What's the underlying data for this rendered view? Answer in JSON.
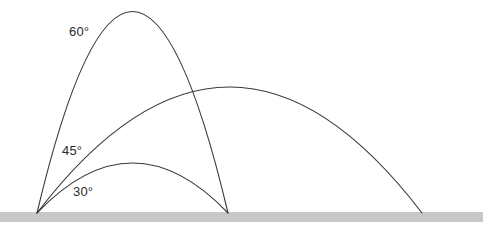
{
  "figure": {
    "width": 483,
    "height": 230,
    "background_color": "#ffffff",
    "clipped_top_text": ""
  },
  "ground": {
    "label": "ground",
    "color": "#c8c8c8",
    "x": 0,
    "y": 212,
    "width": 483,
    "height": 10
  },
  "launch_point": {
    "label": "launch point",
    "x": 37,
    "y": 213
  },
  "labels": {
    "angle_60": "60°",
    "angle_45": "45°",
    "angle_30": "30°"
  },
  "style": {
    "curve_color": "#3a3a3a",
    "curve_width": 1.1,
    "label_color": "#2b2b2b"
  },
  "chart_data": {
    "type": "line",
    "xlabel": "",
    "ylabel": "",
    "xlim": [
      0,
      483
    ],
    "ylim": [
      0,
      230
    ],
    "grid": false,
    "legend": "inline-annotations",
    "origin": [
      37,
      213
    ],
    "ground_y": 212,
    "series": [
      {
        "name": "60°",
        "angle_deg": 60,
        "launch_x": 37,
        "landing_x": 228,
        "range_px": 191,
        "apex_x": 130,
        "apex_y": 11,
        "peak_height_px": 202,
        "path": "M 37 213 Q 132.5 -190 228 213"
      },
      {
        "name": "45°",
        "angle_deg": 45,
        "launch_x": 37,
        "landing_x": 422,
        "range_px": 385,
        "apex_x": 225,
        "apex_y": 87,
        "peak_height_px": 126,
        "path": "M 37 213 Q 229.5 -39 422 213"
      },
      {
        "name": "30°",
        "angle_deg": 30,
        "launch_x": 37,
        "landing_x": 228,
        "range_px": 191,
        "apex_x": 133,
        "apex_y": 163,
        "peak_height_px": 50,
        "path": "M 37 213 Q 132.5 113 228 213"
      }
    ],
    "annotations": [
      {
        "text": "60°",
        "x": 69,
        "y": 33
      },
      {
        "text": "45°",
        "x": 62,
        "y": 152
      },
      {
        "text": "30°",
        "x": 73,
        "y": 193
      }
    ]
  }
}
